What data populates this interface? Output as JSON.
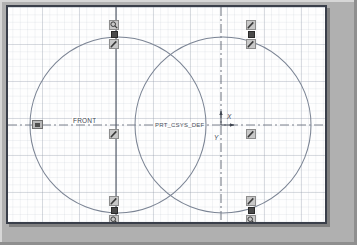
{
  "window": {
    "app": "CAD Sketcher",
    "canvas_background": "#fefefe",
    "frame_color": "#3a3f4a",
    "desktop_color": "#b0b0b0",
    "grid_color": "#969eac",
    "geometry_color": "#7b8494",
    "centerline_color": "#6b7280"
  },
  "labels": {
    "front_plane": "FRONT",
    "coord_system": "PRT_CSYS_DEF",
    "axis_x": "X",
    "axis_y": "Y"
  },
  "sketch": {
    "circles": [
      {
        "name": "circle-left",
        "cx": 110,
        "cy": 118,
        "r": 88
      },
      {
        "name": "circle-right",
        "cx": 215,
        "cy": 118,
        "r": 88
      }
    ],
    "centerlines": [
      {
        "name": "centerline-horizontal",
        "orientation": "horizontal",
        "position": 118
      },
      {
        "name": "centerline-vertical-left",
        "orientation": "vertical",
        "position": 108
      },
      {
        "name": "centerline-vertical-right",
        "orientation": "vertical",
        "position": 213
      }
    ]
  },
  "handles": [
    {
      "name": "handle-cluster-top-left",
      "x": 101,
      "y": 13,
      "icons": [
        "magnifier-icon",
        "grip-handle",
        "pencil-icon"
      ]
    },
    {
      "name": "handle-cluster-top-right",
      "x": 238,
      "y": 13,
      "icons": [
        "pencil-icon",
        "grip-handle",
        "pencil-icon"
      ]
    },
    {
      "name": "handle-cluster-middle-left",
      "x": 101,
      "y": 122,
      "icons": [
        "pencil-icon"
      ]
    },
    {
      "name": "handle-cluster-middle-right",
      "x": 238,
      "y": 122,
      "icons": [
        "pencil-icon"
      ]
    },
    {
      "name": "handle-cluster-bottom-left",
      "x": 101,
      "y": 189,
      "icons": [
        "pencil-icon",
        "grip-handle",
        "magnifier-icon"
      ]
    },
    {
      "name": "handle-cluster-bottom-right",
      "x": 238,
      "y": 189,
      "icons": [
        "pencil-icon",
        "grip-handle",
        "magnifier-icon"
      ]
    }
  ]
}
